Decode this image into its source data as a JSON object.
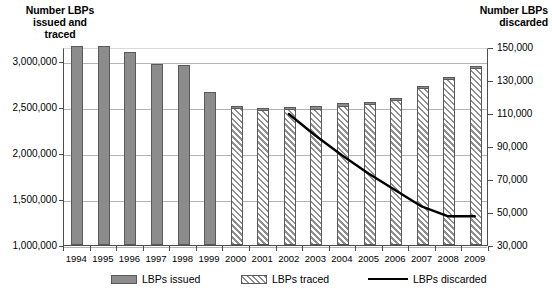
{
  "chart_data": {
    "type": "bar",
    "title": "",
    "subtitle": "",
    "xlabel": "",
    "ylabel": "Number LBPs issued and traced",
    "y2label": "Number LBPs discarded",
    "grid": true,
    "legend_position": "bottom",
    "categories": [
      "1994",
      "1995",
      "1996",
      "1997",
      "1998",
      "1999",
      "2000",
      "2001",
      "2002",
      "2003",
      "2004",
      "2005",
      "2006",
      "2007",
      "2008",
      "2009"
    ],
    "ylim": [
      1000000,
      3150000
    ],
    "yticks": [
      "1,000,000",
      "1,500,000",
      "2,000,000",
      "2,500,000",
      "3,000,000"
    ],
    "ytick_values": [
      1000000,
      1500000,
      2000000,
      2500000,
      3000000
    ],
    "y2lim": [
      30000,
      150000
    ],
    "y2ticks": [
      "30,000",
      "50,000",
      "70,000",
      "90,000",
      "110,000",
      "130,000",
      "150,000"
    ],
    "y2tick_values": [
      30000,
      50000,
      70000,
      90000,
      110000,
      130000,
      150000
    ],
    "series": [
      {
        "name": "LBPs issued",
        "axis": "left",
        "style": "bar-solid-gray",
        "values": [
          3160000,
          3160000,
          3100000,
          2970000,
          2960000,
          2660000,
          2530000,
          2510000,
          2520000,
          2530000,
          2560000,
          2580000,
          2620000,
          2750000,
          2850000,
          2970000
        ]
      },
      {
        "name": "LBPs traced",
        "axis": "left",
        "style": "bar-hatched",
        "values": [
          null,
          null,
          null,
          null,
          null,
          null,
          2500000,
          2480000,
          2490000,
          2490000,
          2520000,
          2540000,
          2580000,
          2710000,
          2820000,
          2940000
        ]
      },
      {
        "name": "LBPs discarded",
        "axis": "right",
        "style": "line-black",
        "values": [
          null,
          null,
          null,
          null,
          null,
          null,
          null,
          null,
          110000,
          97000,
          85000,
          74000,
          64000,
          54000,
          48000,
          48000
        ]
      }
    ]
  },
  "legend": {
    "items": [
      {
        "label": "LBPs issued",
        "swatch": "issued"
      },
      {
        "label": "LBPs traced",
        "swatch": "traced"
      },
      {
        "label": "LBPs discarded",
        "swatch": "line"
      }
    ]
  },
  "axis_titles": {
    "left": "Number LBPs\nissued and\ntraced",
    "right": "Number LBPs\ndiscarded"
  }
}
